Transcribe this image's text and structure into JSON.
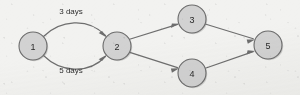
{
  "diagram": {
    "kind": "network-activity-diagram",
    "background_color": "#f2f2f0",
    "node_fill_color": "#d2d2d2",
    "node_stroke_color": "#6b6b6b",
    "edge_color": "#6e6e6e",
    "label_color": "#2f2f2f",
    "nodes": [
      {
        "id": "1",
        "label": "1",
        "cx": 33,
        "cy": 46,
        "r": 14
      },
      {
        "id": "2",
        "label": "2",
        "cx": 117,
        "cy": 46,
        "r": 14
      },
      {
        "id": "3",
        "label": "3",
        "cx": 192,
        "cy": 19,
        "r": 14
      },
      {
        "id": "4",
        "label": "4",
        "cx": 192,
        "cy": 73,
        "r": 14
      },
      {
        "id": "5",
        "label": "5",
        "cx": 268,
        "cy": 45,
        "r": 14
      }
    ],
    "edges": [
      {
        "id": "e-1-3days-2",
        "from": "1",
        "to": "2",
        "style": "curve-up",
        "label": "3 days",
        "label_x": 71,
        "label_y": 11
      },
      {
        "id": "e-1-5days-2",
        "from": "1",
        "to": "2",
        "style": "curve-down",
        "label": "5 days",
        "label_x": 71,
        "label_y": 70
      },
      {
        "id": "e-2-3",
        "from": "2",
        "to": "3",
        "style": "straight",
        "label": ""
      },
      {
        "id": "e-2-4",
        "from": "2",
        "to": "4",
        "style": "straight",
        "label": ""
      },
      {
        "id": "e-3-5",
        "from": "3",
        "to": "5",
        "style": "straight",
        "label": ""
      },
      {
        "id": "e-4-5",
        "from": "4",
        "to": "5",
        "style": "straight",
        "label": ""
      }
    ]
  }
}
